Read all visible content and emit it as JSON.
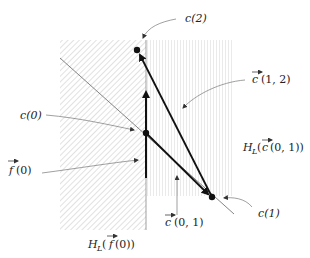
{
  "diagram": {
    "points": {
      "c0": {
        "label": "c(0)",
        "x": 146,
        "y": 133
      },
      "c1": {
        "label": "c(1)",
        "x": 212,
        "y": 197
      },
      "c2": {
        "label": "c(2)",
        "x": 137,
        "y": 50
      }
    },
    "labels": {
      "c0": "c(0)",
      "c1": "c(1)",
      "c2": "c(2)",
      "f0_func": "f",
      "f0_arg": "(0)",
      "c12_func": "c",
      "c12_arg": "(1, 2)",
      "c01_func": "c",
      "c01_arg": "(0, 1)",
      "h_f0_prefix": "H",
      "h_f0_sub": "L",
      "h_f0_open": "(",
      "h_f0_func": "f",
      "h_f0_arg": "(0))",
      "h_c01_prefix": "H",
      "h_c01_sub": "L",
      "h_c01_open": "(",
      "h_c01_func": "c",
      "h_c01_arg": "(0, 1))"
    },
    "regions": {
      "halfspace_f0": {
        "label": "H_L(f(0))",
        "pattern": "diagonal-hatch",
        "x": 60,
        "y": 40,
        "w": 86,
        "h": 190
      },
      "halfspace_c01": {
        "label": "H_L(c(0,1))",
        "pattern": "vertical-lines",
        "x": 146,
        "y": 40,
        "w": 86,
        "h": 156
      }
    },
    "colors": {
      "ink": "#111111",
      "hatch": "#c8c8c8",
      "thin": "#777777"
    }
  }
}
